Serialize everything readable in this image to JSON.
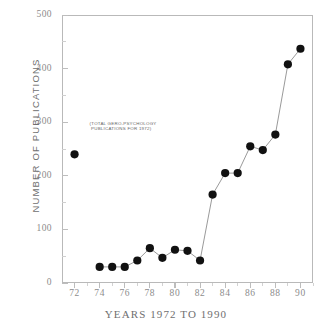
{
  "chart_data": {
    "type": "scatter",
    "title": "",
    "xlabel": "YEARS 1972 TO 1990",
    "ylabel": "NUMBER OF PUBLICATIONS",
    "xlim": [
      71,
      91
    ],
    "ylim": [
      0,
      500
    ],
    "ytick_values": [
      0,
      100,
      200,
      300,
      400,
      500
    ],
    "ytick_labels": [
      "0",
      "100",
      "200",
      "300",
      "400",
      "500"
    ],
    "xtick_values": [
      72,
      74,
      76,
      78,
      80,
      82,
      84,
      86,
      88,
      90
    ],
    "xtick_labels": [
      "72",
      "74",
      "76",
      "78",
      "80",
      "82",
      "84",
      "86",
      "88",
      "90"
    ],
    "xtick_minor_values": [
      73,
      75,
      77,
      79,
      81,
      83,
      85,
      87,
      89,
      91
    ],
    "ytick_minor_values": [
      50,
      150,
      250,
      350,
      450
    ],
    "grid": false,
    "legend": false,
    "marker": "filled-circle",
    "marker_color": "#111111",
    "line_color": "#9a9a9a",
    "frame_color": "#b9b9b9",
    "series": [
      {
        "name": "Isolated 1972 point",
        "connected": false,
        "x": [
          72
        ],
        "y": [
          240
        ]
      },
      {
        "name": "Gero-psychology publications",
        "connected": true,
        "x": [
          74,
          75,
          76,
          77,
          78,
          79,
          80,
          81,
          82,
          83,
          84,
          85,
          86,
          87,
          88,
          89,
          90
        ],
        "y": [
          30,
          30,
          30,
          42,
          65,
          47,
          62,
          60,
          42,
          165,
          205,
          205,
          255,
          248,
          277,
          408,
          437
        ]
      }
    ],
    "annotations": [
      {
        "name": "total-publications-1972-note",
        "text": "(TOTAL GERO-PSYCHOLOGY\n PUBLICATIONS FOR 1972)",
        "x": 73.2,
        "y": 295
      }
    ]
  }
}
